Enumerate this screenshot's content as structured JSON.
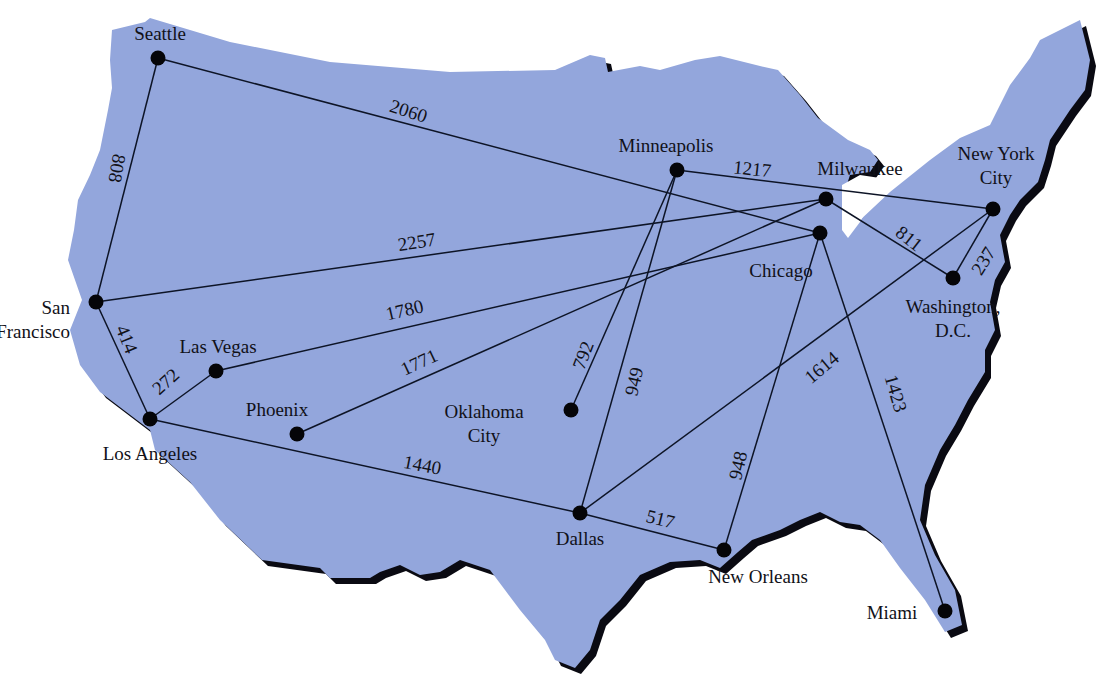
{
  "map": {
    "title": "US city flight distances",
    "land_color": "#93a6dc",
    "shadow_color": "#0a0a12",
    "route_color": "#0d1426",
    "cities": [
      {
        "id": "seattle",
        "name": [
          "Seattle"
        ],
        "x": 158,
        "y": 58,
        "lx": 160,
        "ly": 40,
        "anchor": "middle"
      },
      {
        "id": "san-francisco",
        "name": [
          "San",
          "Francisco"
        ],
        "x": 96,
        "y": 302,
        "lx": 70,
        "ly": 314,
        "anchor": "end"
      },
      {
        "id": "los-angeles",
        "name": [
          "Los Angeles"
        ],
        "x": 150,
        "y": 419,
        "lx": 150,
        "ly": 460,
        "anchor": "middle"
      },
      {
        "id": "las-vegas",
        "name": [
          "Las Vegas"
        ],
        "x": 216,
        "y": 371,
        "lx": 218,
        "ly": 353,
        "anchor": "middle"
      },
      {
        "id": "phoenix",
        "name": [
          "Phoenix"
        ],
        "x": 297,
        "y": 434,
        "lx": 277,
        "ly": 416,
        "anchor": "middle"
      },
      {
        "id": "minneapolis",
        "name": [
          "Minneapolis"
        ],
        "x": 677,
        "y": 170,
        "lx": 666,
        "ly": 152,
        "anchor": "middle"
      },
      {
        "id": "milwaukee",
        "name": [
          "Milwaukee"
        ],
        "x": 826,
        "y": 199,
        "lx": 860,
        "ly": 175,
        "anchor": "middle"
      },
      {
        "id": "chicago",
        "name": [
          "Chicago"
        ],
        "x": 820,
        "y": 233,
        "lx": 781,
        "ly": 277,
        "anchor": "middle"
      },
      {
        "id": "new-york-city",
        "name": [
          "New York",
          "City"
        ],
        "x": 993,
        "y": 209,
        "lx": 996,
        "ly": 160,
        "anchor": "middle"
      },
      {
        "id": "washington-dc",
        "name": [
          "Washington,",
          "D.C."
        ],
        "x": 953,
        "y": 278,
        "lx": 953,
        "ly": 313,
        "anchor": "middle"
      },
      {
        "id": "oklahoma-city",
        "name": [
          "Oklahoma",
          "City"
        ],
        "x": 571,
        "y": 410,
        "lx": 484,
        "ly": 418,
        "anchor": "middle"
      },
      {
        "id": "dallas",
        "name": [
          "Dallas"
        ],
        "x": 580,
        "y": 513,
        "lx": 580,
        "ly": 545,
        "anchor": "middle"
      },
      {
        "id": "new-orleans",
        "name": [
          "New Orleans"
        ],
        "x": 724,
        "y": 550,
        "lx": 758,
        "ly": 583,
        "anchor": "middle"
      },
      {
        "id": "miami",
        "name": [
          "Miami"
        ],
        "x": 945,
        "y": 611,
        "lx": 892,
        "ly": 619,
        "anchor": "middle"
      }
    ],
    "routes": [
      {
        "from": "seattle",
        "to": "san-francisco",
        "distance": "808",
        "lx": 115,
        "ly": 168,
        "rot": 100
      },
      {
        "from": "seattle",
        "to": "chicago",
        "distance": "2060",
        "lx": 408,
        "ly": 113,
        "rot": 18
      },
      {
        "from": "san-francisco",
        "to": "milwaukee",
        "distance": "2257",
        "lx": 417,
        "ly": 244,
        "rot": -9
      },
      {
        "from": "san-francisco",
        "to": "los-angeles",
        "distance": "414",
        "lx": 125,
        "ly": 340,
        "rot": 68
      },
      {
        "from": "los-angeles",
        "to": "las-vegas",
        "distance": "272",
        "lx": 167,
        "ly": 383,
        "rot": -42
      },
      {
        "from": "las-vegas",
        "to": "chicago",
        "distance": "1780",
        "lx": 405,
        "ly": 312,
        "rot": -13
      },
      {
        "from": "phoenix",
        "to": "milwaukee",
        "distance": "1771",
        "lx": 420,
        "ly": 364,
        "rot": -25
      },
      {
        "from": "los-angeles",
        "to": "dallas",
        "distance": "1440",
        "lx": 422,
        "ly": 467,
        "rot": 11
      },
      {
        "from": "minneapolis",
        "to": "new-york-city",
        "distance": "1217",
        "lx": 752,
        "ly": 171,
        "rot": 6
      },
      {
        "from": "minneapolis",
        "to": "oklahoma-city",
        "distance": "792",
        "lx": 585,
        "ly": 356,
        "rot": -69
      },
      {
        "from": "minneapolis",
        "to": "dallas",
        "distance": "949",
        "lx": 636,
        "ly": 382,
        "rot": -77
      },
      {
        "from": "milwaukee",
        "to": "washington-dc",
        "distance": "811",
        "lx": 908,
        "ly": 240,
        "rot": 38
      },
      {
        "from": "new-york-city",
        "to": "washington-dc",
        "distance": "237",
        "lx": 985,
        "ly": 262,
        "rot": -58
      },
      {
        "from": "new-york-city",
        "to": "dallas",
        "distance": "1614",
        "lx": 823,
        "ly": 369,
        "rot": -40
      },
      {
        "from": "chicago",
        "to": "new-orleans",
        "distance": "948",
        "lx": 740,
        "ly": 466,
        "rot": -77
      },
      {
        "from": "chicago",
        "to": "miami",
        "distance": "1423",
        "lx": 894,
        "ly": 394,
        "rot": 74
      },
      {
        "from": "dallas",
        "to": "new-orleans",
        "distance": "517",
        "lx": 660,
        "ly": 521,
        "rot": 14
      }
    ]
  }
}
